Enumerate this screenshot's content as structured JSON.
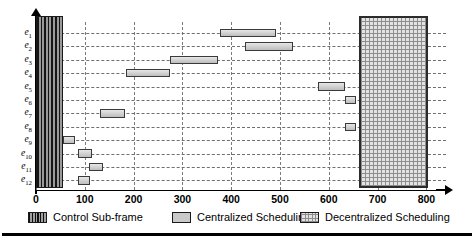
{
  "chart_data": {
    "type": "bar",
    "orientation": "horizontal",
    "subtype": "gantt",
    "title": "",
    "xlabel": "",
    "ylabel": "",
    "xlim": [
      0,
      840
    ],
    "ylim_categories": [
      "e1",
      "e2",
      "e3",
      "e4",
      "e5",
      "e6",
      "e7",
      "e8",
      "e9",
      "e10",
      "e11",
      "e12"
    ],
    "xticks": [
      0,
      100,
      200,
      300,
      400,
      500,
      600,
      700,
      800
    ],
    "xtick_labels": [
      "0",
      "100",
      "200",
      "300",
      "400",
      "500",
      "600",
      "700",
      "800"
    ],
    "grid": true,
    "grid_style": "dashed",
    "legend_position": "bottom",
    "categories": [
      "e1",
      "e2",
      "e3",
      "e4",
      "e5",
      "e6",
      "e7",
      "e8",
      "e9",
      "e10",
      "e11",
      "e12"
    ],
    "category_labels": [
      {
        "base": "e",
        "sub": "1"
      },
      {
        "base": "e",
        "sub": "2"
      },
      {
        "base": "e",
        "sub": "3"
      },
      {
        "base": "e",
        "sub": "4"
      },
      {
        "base": "e",
        "sub": "5"
      },
      {
        "base": "e",
        "sub": "6"
      },
      {
        "base": "e",
        "sub": "7"
      },
      {
        "base": "e",
        "sub": "8"
      },
      {
        "base": "e",
        "sub": "9"
      },
      {
        "base": "e",
        "sub": "10"
      },
      {
        "base": "e",
        "sub": "11"
      },
      {
        "base": "e",
        "sub": "12"
      }
    ],
    "series": [
      {
        "name": "Centralized Scheduling",
        "color": "#c9c9c9",
        "tasks": [
          {
            "row": "e1",
            "start": 378,
            "end": 492
          },
          {
            "row": "e2",
            "start": 428,
            "end": 527
          },
          {
            "row": "e3",
            "start": 275,
            "end": 374
          },
          {
            "row": "e4",
            "start": 185,
            "end": 275
          },
          {
            "row": "e5",
            "start": 578,
            "end": 634
          },
          {
            "row": "e6",
            "start": 634,
            "end": 655
          },
          {
            "row": "e7",
            "start": 132,
            "end": 183
          },
          {
            "row": "e8",
            "start": 634,
            "end": 655
          },
          {
            "row": "e9",
            "start": 56,
            "end": 80
          },
          {
            "row": "e10",
            "start": 86,
            "end": 115
          },
          {
            "row": "e11",
            "start": 109,
            "end": 138
          },
          {
            "row": "e12",
            "start": 86,
            "end": 111
          }
        ]
      },
      {
        "name": "Control Sub-frame",
        "color": "#4a4a4a",
        "tasks": [
          {
            "row": "all",
            "start": 0,
            "end": 56
          }
        ]
      },
      {
        "name": "Decentralized Scheduling",
        "color": "#e3e3e3",
        "tasks": [
          {
            "row": "all",
            "start": 661,
            "end": 804
          }
        ]
      }
    ]
  },
  "legend": {
    "items": [
      {
        "label": "Control Sub-frame",
        "swatch": "ctrl"
      },
      {
        "label": "Centralized Scheduling",
        "swatch": "cent"
      },
      {
        "label": "Decentralized Scheduling",
        "swatch": "dec"
      }
    ]
  },
  "axis": {
    "x_ticks": [
      "0",
      "100",
      "200",
      "300",
      "400",
      "500",
      "600",
      "700",
      "800"
    ]
  }
}
